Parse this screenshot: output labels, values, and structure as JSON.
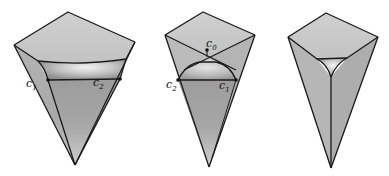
{
  "figure": {
    "panels": [
      {
        "id": "panel-1",
        "labels": [
          {
            "name": "c",
            "sub": "1",
            "x": 26,
            "y": 87
          },
          {
            "name": "c",
            "sub": "2",
            "x": 93,
            "y": 86
          }
        ]
      },
      {
        "id": "panel-2",
        "labels": [
          {
            "name": "c",
            "sub": "0",
            "x": 206,
            "y": 47
          },
          {
            "name": "c",
            "sub": "2",
            "x": 166,
            "y": 88
          },
          {
            "name": "c",
            "sub": "1",
            "x": 219,
            "y": 89
          }
        ]
      },
      {
        "id": "panel-3",
        "labels": []
      }
    ],
    "colors": {
      "top_face": "#c9c9c9",
      "side_face_light": "#bdbdbd",
      "side_face_dark": "#a6a6a6",
      "cup_inner": "#d8d8d8",
      "cup_highlight": "#ececec",
      "edge": "#1a1a1a",
      "background": "#ffffff"
    }
  }
}
